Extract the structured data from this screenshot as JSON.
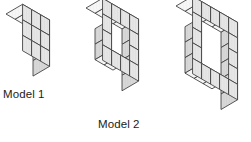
{
  "figure": {
    "kind": "isometric-cube-models",
    "background_color": "#ffffff",
    "stroke_color": "#3b3b3b",
    "face_top_color": "#f4f4f4",
    "face_left_color": "#e2e2e2",
    "face_right_color": "#d2d2d2",
    "labels": [
      {
        "id": "model-1",
        "text": "Model 1"
      },
      {
        "id": "model-2",
        "text": "Model 2"
      }
    ],
    "footer_mark": "",
    "models": [
      {
        "name": "Model 1",
        "grid_width": 3,
        "grid_height": 3,
        "depth": 2,
        "hole_cells": [],
        "total_visible_cubes": 9,
        "origin_x": 6,
        "origin_y": 14,
        "cube_size": 18,
        "depth_cubes": 2
      },
      {
        "name": "Model 2",
        "grid_width": 4,
        "grid_height": 4,
        "depth": 2,
        "hole_cells": [
          [
            1,
            1
          ],
          [
            2,
            1
          ],
          [
            1,
            2
          ],
          [
            2,
            2
          ]
        ],
        "total_visible_cubes": 12,
        "origin_x": 86,
        "origin_y": 8,
        "cube_size": 18,
        "depth_cubes": 2
      },
      {
        "name": "Model 3",
        "grid_width": 5,
        "grid_height": 5,
        "depth": 2,
        "hole_cells": [
          [
            1,
            1
          ],
          [
            2,
            1
          ],
          [
            3,
            1
          ],
          [
            1,
            2
          ],
          [
            2,
            2
          ],
          [
            3,
            2
          ],
          [
            1,
            3
          ],
          [
            2,
            3
          ],
          [
            3,
            3
          ]
        ],
        "total_visible_cubes": 16,
        "origin_x": 176,
        "origin_y": 6,
        "cube_size": 18,
        "depth_cubes": 2
      }
    ]
  }
}
